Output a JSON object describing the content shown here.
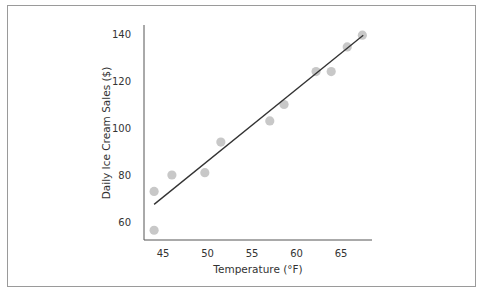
{
  "chart_data": {
    "type": "scatter",
    "title": "",
    "xlabel": "Temperature (°F)",
    "ylabel": "Daily Ice Cream Sales ($)",
    "xlim": [
      43,
      68.5
    ],
    "ylim": [
      53,
      143
    ],
    "xticks": [
      45,
      50,
      55,
      60,
      65
    ],
    "yticks": [
      60,
      80,
      100,
      120,
      140
    ],
    "grid": false,
    "legend": null,
    "series": [
      {
        "name": "Observations",
        "color": "#c8c8c8",
        "points": [
          {
            "x": 44.0,
            "y": 73
          },
          {
            "x": 44.0,
            "y": 56.5
          },
          {
            "x": 46.0,
            "y": 80
          },
          {
            "x": 49.7,
            "y": 81
          },
          {
            "x": 51.5,
            "y": 94
          },
          {
            "x": 57.0,
            "y": 103
          },
          {
            "x": 58.6,
            "y": 110
          },
          {
            "x": 62.2,
            "y": 124
          },
          {
            "x": 63.9,
            "y": 124
          },
          {
            "x": 65.7,
            "y": 134.5
          },
          {
            "x": 67.4,
            "y": 139.5
          }
        ]
      }
    ],
    "trendline": {
      "color": "#333333",
      "from": {
        "x": 44.0,
        "y": 67.5
      },
      "to": {
        "x": 67.5,
        "y": 139.5
      }
    }
  }
}
